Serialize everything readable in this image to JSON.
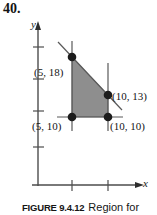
{
  "problem": {
    "number": "40."
  },
  "figure": {
    "axes": {
      "y_label": "y",
      "x_label": "x",
      "axis_color": "#4d4d4d",
      "y_ticks": 4,
      "x_ticks": 2
    },
    "region": {
      "fill_color": "#8e8e8e",
      "edge_color": "#3a3a3a",
      "vertices": [
        {
          "x": 5,
          "y": 10
        },
        {
          "x": 5,
          "y": 18
        },
        {
          "x": 10,
          "y": 13
        },
        {
          "x": 10,
          "y": 10
        }
      ]
    },
    "points": [
      {
        "id": "p-5-18",
        "label": "(5, 18)",
        "x": 5,
        "y": 18
      },
      {
        "id": "p-5-10",
        "label": "(5, 10)",
        "x": 5,
        "y": 10
      },
      {
        "id": "p-10-13",
        "label": "(10, 13)",
        "x": 10,
        "y": 13
      },
      {
        "id": "p-10-10",
        "label": "(10, 10)",
        "x": 10,
        "y": 10
      }
    ]
  },
  "caption": {
    "tag": "FIGURE 9.4.12",
    "text": "Region for"
  }
}
